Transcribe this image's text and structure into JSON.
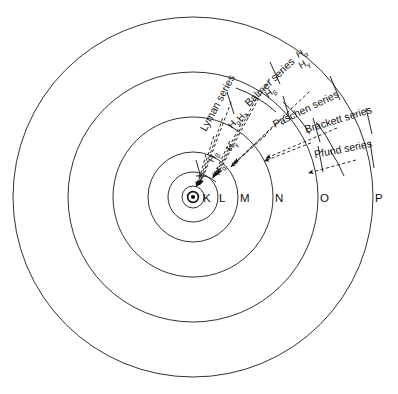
{
  "figure": {
    "background_color": "#ffffff",
    "stroke_color": "#111111",
    "width": 398,
    "height": 394
  },
  "nucleus": {
    "label": "nucleus",
    "center_x": 193,
    "center_y": 197,
    "ring_radius": 5.4,
    "dot_radius": 2.1
  },
  "shells": [
    {
      "label": "K",
      "n": 1,
      "radius": 11,
      "label_x": 203,
      "label_y": 202
    },
    {
      "label": "L",
      "n": 2,
      "radius": 25,
      "label_x": 219,
      "label_y": 202
    },
    {
      "label": "M",
      "n": 3,
      "radius": 45,
      "label_x": 240,
      "label_y": 202
    },
    {
      "label": "N",
      "n": 4,
      "radius": 80,
      "label_x": 275,
      "label_y": 202
    },
    {
      "label": "O",
      "n": 5,
      "radius": 125,
      "label_x": 320,
      "label_y": 202
    },
    {
      "label": "P",
      "n": 6,
      "radius": 180,
      "label_x": 375,
      "label_y": 202
    }
  ],
  "series": [
    {
      "name": "Lyman series",
      "label": "Lyman series",
      "lines": [
        "Hα",
        "Hβ",
        "Hγ",
        "Hδ"
      ],
      "label_x": 206,
      "label_y": 132,
      "rotation": -62
    },
    {
      "name": "Balmer series",
      "label": "Balmer series",
      "lines": [
        "Hα",
        "Hβ",
        "Hγ"
      ],
      "label_x": 249,
      "label_y": 107,
      "rotation": -44
    },
    {
      "name": "Paschen series",
      "label": "Paschen series",
      "lines": [
        "Hα",
        "Hβ"
      ],
      "label_x": 275,
      "label_y": 128,
      "rotation": -26
    },
    {
      "name": "Brackett series",
      "label": "Brackett series",
      "lines": [
        "Hα"
      ],
      "label_x": 306,
      "label_y": 133,
      "rotation": -17
    },
    {
      "name": "Pfund series",
      "label": "Pfund series",
      "lines": [],
      "label_x": 315,
      "label_y": 158,
      "rotation": -11
    }
  ],
  "line_labels": [
    {
      "text": "H",
      "sub": "α",
      "x": 219,
      "y": 176,
      "rotation": -60
    },
    {
      "text": "H",
      "sub": "β",
      "x": 213,
      "y": 163,
      "rotation": -60
    },
    {
      "text": "H",
      "sub": "γ",
      "x": 231,
      "y": 152,
      "rotation": -56
    },
    {
      "text": "H",
      "sub": "δ",
      "x": 241,
      "y": 122,
      "rotation": -50
    },
    {
      "text": "H",
      "sub": "α",
      "x": 232,
      "y": 129,
      "rotation": -46
    },
    {
      "text": "H",
      "sub": "β",
      "x": 268,
      "y": 98,
      "rotation": -38
    },
    {
      "text": "H",
      "sub": "γ",
      "x": 301,
      "y": 69,
      "rotation": -30
    },
    {
      "text": "H",
      "sub": "α",
      "x": 298,
      "y": 58,
      "rotation": -26
    }
  ]
}
